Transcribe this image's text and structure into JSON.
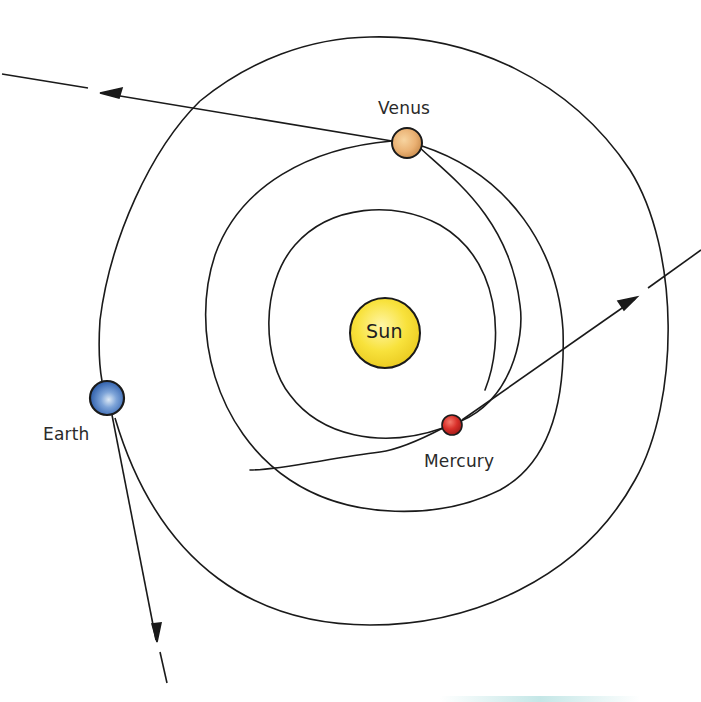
{
  "diagram": {
    "title": "",
    "colors": {
      "background": "#ffffff",
      "line": "#1a1a1a",
      "sun": "#f6e13a",
      "venus": "#e8b57a",
      "earth": "#4a78c0",
      "mercury": "#d8332b"
    },
    "bodies": [
      {
        "id": "sun",
        "label": "Sun",
        "cx": 385,
        "cy": 333,
        "r": 35
      },
      {
        "id": "venus",
        "label": "Venus",
        "cx": 407,
        "cy": 143,
        "r": 15
      },
      {
        "id": "earth",
        "label": "Earth",
        "cx": 107,
        "cy": 398,
        "r": 17
      },
      {
        "id": "mercury",
        "label": "Mercury",
        "cx": 452,
        "cy": 425,
        "r": 10
      }
    ],
    "labels": {
      "sun": "Sun",
      "venus": "Venus",
      "earth": "Earth",
      "mercury": "Mercury"
    },
    "trajectories": [
      {
        "from": "venus",
        "direction": "left",
        "arrow": true
      },
      {
        "from": "mercury",
        "direction": "upper-right",
        "arrow": true
      },
      {
        "from": "earth",
        "direction": "down",
        "arrow": true
      }
    ]
  }
}
